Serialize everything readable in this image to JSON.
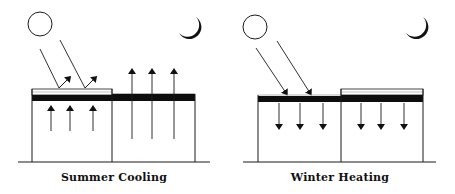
{
  "figure": {
    "panels": [
      {
        "id": "summer",
        "caption": "Summer Cooling",
        "sun": "sun-icon",
        "moon": "moon-icon",
        "insulation_on": "left",
        "left_arrows": "up",
        "right_arrows": "up"
      },
      {
        "id": "winter",
        "caption": "Winter Heating",
        "sun": "sun-icon",
        "moon": "moon-icon",
        "insulation_on": "right",
        "left_arrows": "down",
        "right_arrows": "down"
      }
    ],
    "colors": {
      "line": "#1a1a1a",
      "roof": "#0d0d0d",
      "background": "#ffffff"
    }
  }
}
